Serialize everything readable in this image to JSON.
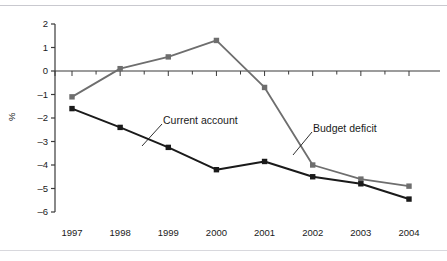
{
  "chart_data": {
    "type": "line",
    "title": "",
    "subtitle": "",
    "xlabel": "",
    "ylabel": "%",
    "categories": [
      "1997",
      "1998",
      "1999",
      "2000",
      "2001",
      "2002",
      "2003",
      "2004"
    ],
    "x": [
      1997,
      1998,
      1999,
      2000,
      2001,
      2002,
      2003,
      2004
    ],
    "ylim": [
      -6,
      2
    ],
    "yticks": [
      2,
      1,
      0,
      -1,
      -2,
      -3,
      -4,
      -5,
      -6
    ],
    "ytick_labels": [
      "2",
      "1",
      "0",
      "-1",
      "-2",
      "-3",
      "-4",
      "-5",
      "-6"
    ],
    "grid": false,
    "legend": "inline-annotations",
    "zero_line": true,
    "series": [
      {
        "name": "Budget deficit",
        "color": "#6e6e6e",
        "marker": "square",
        "values": [
          -1.1,
          0.1,
          0.6,
          1.3,
          -0.7,
          -4.0,
          -4.6,
          -4.9
        ]
      },
      {
        "name": "Current account",
        "color": "#1a1a1a",
        "marker": "square",
        "values": [
          -1.6,
          -2.4,
          -3.25,
          -4.2,
          -3.85,
          -4.5,
          -4.8,
          -5.45
        ]
      }
    ],
    "annotations": [
      {
        "text": "Current account",
        "series": "Current account"
      },
      {
        "text": "Budget deficit",
        "series": "Budget deficit"
      }
    ]
  },
  "colors": {
    "budget_deficit": "#6e6e6e",
    "current_account": "#1a1a1a",
    "axis": "#3a3a3a",
    "rule": "#c9c9cf",
    "background": "#ffffff"
  }
}
